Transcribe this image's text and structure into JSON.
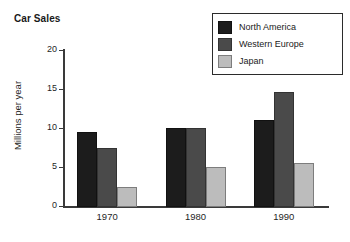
{
  "chart_data": {
    "type": "bar",
    "title": "Car Sales",
    "xlabel": "",
    "ylabel": "Millions per year",
    "categories": [
      "1970",
      "1980",
      "1990"
    ],
    "series": [
      {
        "name": "North America",
        "color": "#1c1c1c",
        "values": [
          9.5,
          10.1,
          11.1
        ]
      },
      {
        "name": "Western Europe",
        "color": "#4a4a4a",
        "values": [
          7.5,
          10.1,
          14.7
        ]
      },
      {
        "name": "Japan",
        "color": "#bcbcbc",
        "values": [
          2.5,
          5.1,
          5.6
        ]
      }
    ],
    "ylim": [
      0,
      20
    ],
    "yticks": [
      0,
      5,
      10,
      15,
      20
    ],
    "ytick_labels": [
      "0",
      "5",
      "10",
      "15",
      "20"
    ],
    "grid": false,
    "legend_position": "top-right"
  },
  "legend": {
    "entries": [
      {
        "label": "North America"
      },
      {
        "label": "Western Europe"
      },
      {
        "label": "Japan"
      }
    ]
  },
  "axis": {
    "y_title": "Millions per year",
    "y_labels": [
      "20",
      "15",
      "10",
      "5",
      "0"
    ],
    "x_labels": [
      "1970",
      "1980",
      "1990"
    ]
  }
}
